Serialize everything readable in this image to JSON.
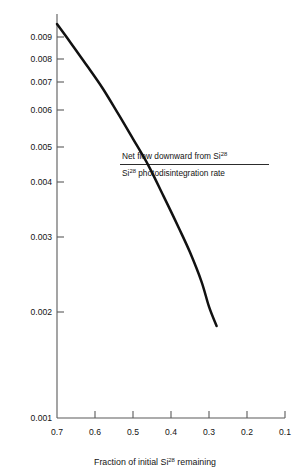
{
  "chart_data": {
    "type": "line",
    "title": "",
    "subtitle": "",
    "xlabel_parts": {
      "pre": "Fraction of initial Si",
      "sup": "28",
      "post": " remaining"
    },
    "xlabel": "Fraction of initial Si28 remaining",
    "ylabel": "",
    "annotation": {
      "numerator_pre": "Net flow downward from Si",
      "numerator_sup": "28",
      "numerator": "Net flow downward from Si28",
      "denominator_pre": "Si",
      "denominator_sup": "28",
      "denominator_post": " photodisintegration rate",
      "denominator": "Si28 photodisintegration rate",
      "form": "fraction"
    },
    "x_axis": {
      "scale": "linear",
      "direction": "decreasing",
      "ticks": [
        0.7,
        0.6,
        0.5,
        0.4,
        0.3,
        0.2,
        0.1
      ],
      "tick_labels": [
        "0.7",
        "0.6",
        "0.5",
        "0.4",
        "0.3",
        "0.2",
        "0.1"
      ],
      "xlim": [
        0.7,
        0.1
      ]
    },
    "y_axis": {
      "scale": "log",
      "ticks": [
        0.009,
        0.008,
        0.007,
        0.006,
        0.005,
        0.004,
        0.003,
        0.002,
        0.001
      ],
      "tick_labels": [
        "0.009",
        "0.008",
        "0.007",
        "0.006",
        "0.005",
        "0.004",
        "0.003",
        "0.002",
        "0.001"
      ],
      "ylim": [
        0.001,
        0.0098
      ]
    },
    "grid": false,
    "legend": false,
    "series": [
      {
        "name": "Net flow downward from Si28 / Si28 photodisintegration rate",
        "x": [
          0.7,
          0.66,
          0.62,
          0.58,
          0.54,
          0.5,
          0.46,
          0.42,
          0.38,
          0.35,
          0.32,
          0.3,
          0.28
        ],
        "y": [
          0.0097,
          0.0086,
          0.0076,
          0.0067,
          0.0058,
          0.005,
          0.0043,
          0.0036,
          0.003,
          0.0026,
          0.0022,
          0.0019,
          0.0017
        ]
      }
    ],
    "colors": {
      "curve": "#111111",
      "axis": "#5a5a5a",
      "text": "#141414",
      "background": "#ffffff"
    }
  },
  "geometry": {
    "y_ticks_px": [
      {
        "label": "0.009",
        "y": 37
      },
      {
        "label": "0.008",
        "y": 59
      },
      {
        "label": "0.007",
        "y": 82
      },
      {
        "label": "0.006",
        "y": 110
      },
      {
        "label": "0.005",
        "y": 147
      },
      {
        "label": "0.004",
        "y": 182
      },
      {
        "label": "0.003",
        "y": 237
      },
      {
        "label": "0.002",
        "y": 312
      },
      {
        "label": "0.001",
        "y": 418
      }
    ],
    "x_ticks_px": [
      {
        "label": "0.7",
        "x": 57
      },
      {
        "label": "0.6",
        "x": 95
      },
      {
        "label": "0.5",
        "x": 133
      },
      {
        "label": "0.4",
        "x": 171
      },
      {
        "label": "0.3",
        "x": 209
      },
      {
        "label": "0.2",
        "x": 247
      },
      {
        "label": "0.1",
        "x": 285
      }
    ],
    "curve_path": "M 57,18 C 78,57 98,104 120,160 C 140,212 158,262 176,300 C 192,330 206,344 216,350"
  }
}
